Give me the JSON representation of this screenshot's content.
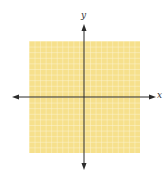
{
  "diagram": {
    "type": "coordinate-plane",
    "axes": {
      "x_label": "x",
      "y_label": "y",
      "x_axis_arrows": "both",
      "y_axis_arrows": "both"
    },
    "grid": {
      "columns": 20,
      "rows": 20,
      "tick_labels": "none"
    },
    "colors": {
      "grid_fill": "#f6e08c",
      "grid_lines": "#fdf5d6",
      "axes": "#2b2b2b",
      "background": "#ffffff"
    }
  }
}
